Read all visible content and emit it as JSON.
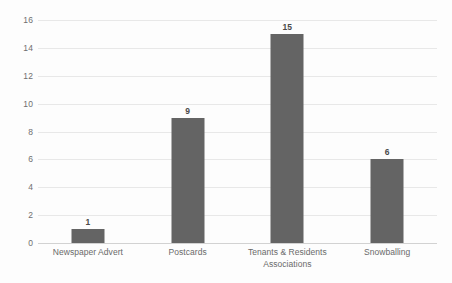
{
  "chart_data": {
    "type": "bar",
    "title": "",
    "subtitle": "",
    "xlabel": "",
    "ylabel": "",
    "categories": [
      "Newspaper Advert",
      "Postcards",
      "Tenants & Residents Associations",
      "Snowballing"
    ],
    "values": [
      1,
      9,
      15,
      6
    ],
    "data_labels": [
      "1",
      "9",
      "15",
      "6"
    ],
    "ylim": [
      0,
      16
    ],
    "ytick_values": [
      0,
      2,
      4,
      6,
      8,
      10,
      12,
      14,
      16
    ],
    "ytick_labels": [
      "0",
      "2",
      "4",
      "6",
      "8",
      "10",
      "12",
      "14",
      "16"
    ],
    "grid": true,
    "grid_axis": "y",
    "legend": false,
    "legend_position": "none",
    "series": [
      {
        "name": "Recruitment method",
        "values": [
          1,
          9,
          15,
          6
        ]
      }
    ],
    "colors": {
      "bar_fill": "#646464",
      "gridline": "#e8e8e8",
      "axis_line": "#d2d2d2",
      "tick_label": "#6a6a6a",
      "data_label": "#4a4a4a",
      "background": "#fdfdfd"
    }
  }
}
